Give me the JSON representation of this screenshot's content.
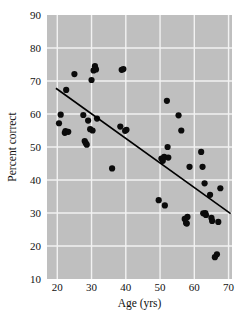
{
  "chart_data": {
    "type": "scatter",
    "title": "",
    "xlabel": "Age (yrs)",
    "ylabel": "Percent correct",
    "xlim": [
      17,
      71
    ],
    "ylim": [
      10,
      90
    ],
    "xticks": [
      20,
      30,
      40,
      50,
      60,
      70
    ],
    "yticks": [
      10,
      20,
      30,
      40,
      50,
      60,
      70,
      80,
      90
    ],
    "grid": true,
    "legend": null,
    "plot_background": "#bfbfbf",
    "grid_color": "#f2f2f2",
    "point_color": "#0b0b0b",
    "line_color": "#000000",
    "x": [
      20.5,
      21.0,
      22.2,
      22.4,
      22.6,
      23.2,
      25.0,
      27.6,
      28.0,
      28.3,
      28.6,
      29.0,
      29.6,
      30.0,
      30.3,
      30.6,
      31.0,
      31.3,
      31.6,
      36.0,
      38.4,
      38.8,
      39.3,
      39.8,
      40.2,
      49.6,
      50.4,
      50.8,
      51.2,
      51.4,
      52.0,
      52.2,
      52.4,
      55.4,
      56.2,
      57.2,
      57.6,
      57.8,
      58.0,
      58.6,
      62.0,
      62.4,
      62.6,
      63.0,
      63.2,
      63.4,
      64.6,
      65.0,
      65.2,
      66.0,
      66.6,
      67.0,
      67.6
    ],
    "y": [
      57.2,
      59.8,
      54.3,
      54.8,
      67.3,
      54.6,
      72.1,
      59.7,
      51.8,
      51.2,
      50.7,
      58.0,
      55.4,
      70.3,
      55.0,
      73.2,
      74.5,
      73.5,
      58.6,
      43.5,
      56.2,
      73.4,
      73.6,
      54.9,
      55.2,
      33.9,
      46.5,
      45.8,
      47.0,
      32.3,
      64.0,
      50.0,
      46.8,
      59.6,
      55.0,
      28.2,
      27.0,
      26.8,
      28.8,
      44.0,
      48.5,
      44.0,
      29.9,
      39.0,
      30.0,
      29.4,
      35.5,
      28.5,
      27.6,
      16.6,
      17.5,
      27.3,
      37.5
    ],
    "trend_line": {
      "x_start": 19.6,
      "y_start": 67.8,
      "x_end": 70.6,
      "y_end": 29.8,
      "description": "linear-regression-fit"
    },
    "n_points": 53
  },
  "axes": {
    "x_tick_labels": [
      "20",
      "30",
      "40",
      "50",
      "60",
      "70"
    ],
    "y_tick_labels": [
      "10",
      "20",
      "30",
      "40",
      "50",
      "60",
      "70",
      "80",
      "90"
    ],
    "x_axis_title": "Age (yrs)",
    "y_axis_title": "Percent correct"
  }
}
